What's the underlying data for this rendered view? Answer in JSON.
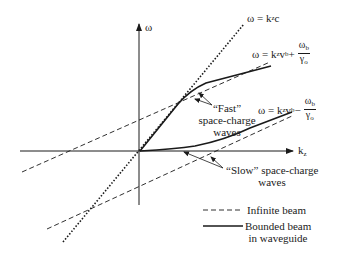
{
  "axes": {
    "y_label": "ω",
    "x_label": "k",
    "x_label_sub": "z"
  },
  "equations": {
    "light_line": {
      "lhs": "ω = k",
      "sub": "z",
      "rhs": "c"
    },
    "fast_line": {
      "lhs": "ω = k",
      "sub": "z",
      "mid": " v",
      "mid_sub": "b",
      "op": " +",
      "num": "ω",
      "num_sub": "b",
      "den": "γ",
      "den_sub": "o"
    },
    "slow_line": {
      "lhs": "ω = k",
      "sub": "z",
      "mid": " v",
      "mid_sub": "b",
      "op": " −",
      "num": "ω",
      "num_sub": "b",
      "den": "γ",
      "den_sub": "o"
    }
  },
  "annotations": {
    "fast": {
      "line1": "“Fast”",
      "line2": "space-charge",
      "line3": "waves"
    },
    "slow": {
      "line1": "“Slow” space-charge",
      "line2": "waves"
    }
  },
  "legend": {
    "items": [
      {
        "style": "dashed",
        "label": "Infinite beam"
      },
      {
        "style": "solid",
        "label": "Bounded beam",
        "label2": "in waveguide"
      }
    ]
  }
}
